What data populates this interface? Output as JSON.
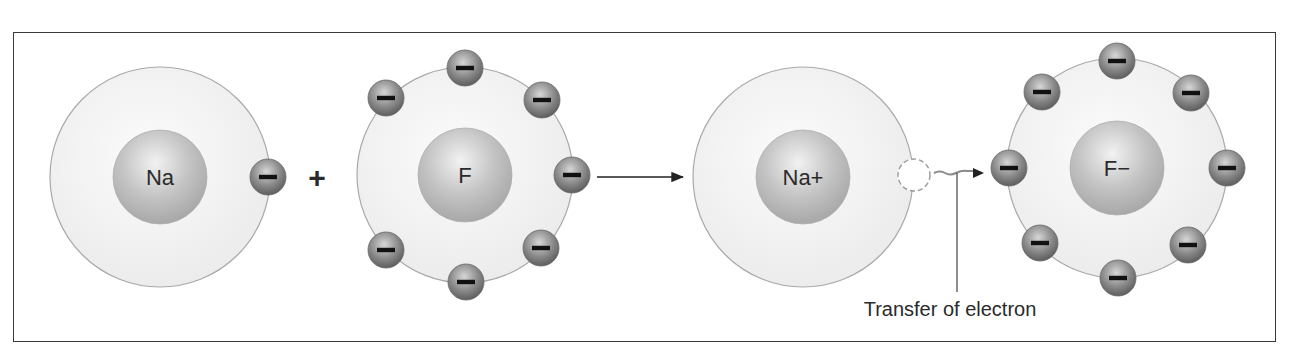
{
  "diagram": {
    "atoms": [
      {
        "id": "na",
        "label": "Na",
        "shell_electrons": 1
      },
      {
        "id": "f",
        "label": "F",
        "shell_electrons": 7
      },
      {
        "id": "na_ion",
        "label": "Na+",
        "shell_electrons": 0
      },
      {
        "id": "f_ion",
        "label": "F−",
        "shell_electrons": 8
      }
    ],
    "operator_plus": "+",
    "electron_symbol": "−",
    "annotation": "Transfer of electron",
    "colors": {
      "frame": "#3a3a3a",
      "shell_fill": "#f1f1f1",
      "shell_stroke": "#a9a9a9",
      "nucleus": "#b8b8b8",
      "nucleus_highlight": "#e9e9e9",
      "electron": "#7d7d7d",
      "electron_highlight": "#c9c9c9",
      "text": "#2a2a2a"
    }
  }
}
